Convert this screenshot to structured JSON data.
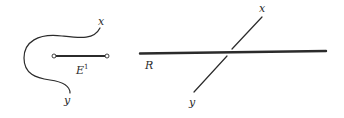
{
  "figure": {
    "left_panel": {
      "curve_end_top_label": "x",
      "curve_end_bottom_label": "y",
      "segment_label": "E",
      "segment_label_superscript": "1"
    },
    "right_panel": {
      "line_label": "R",
      "crossing_line_top_label": "x",
      "crossing_line_bottom_label": "y"
    },
    "colors": {
      "ink": "#2b2b2b",
      "background": "#ffffff"
    }
  }
}
